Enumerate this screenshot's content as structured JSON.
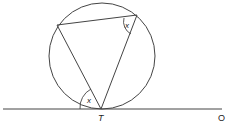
{
  "diagram": {
    "labels": {
      "point_T": "T",
      "point_O": "O",
      "angle_top": "x",
      "angle_tangent": "x"
    },
    "colors": {
      "stroke": "#333333",
      "background": "#ffffff"
    }
  }
}
